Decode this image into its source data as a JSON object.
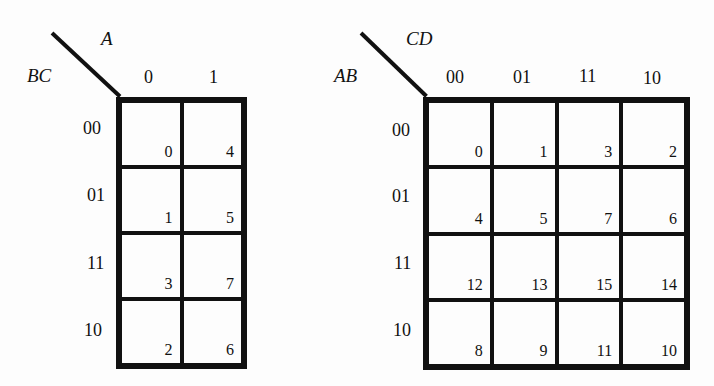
{
  "maps": [
    {
      "id": "three-variable",
      "col_var": "A",
      "row_var": "BC",
      "col_labels": [
        "0",
        "1"
      ],
      "row_labels": [
        "00",
        "01",
        "11",
        "10"
      ],
      "cells": [
        [
          "0",
          "4"
        ],
        [
          "1",
          "5"
        ],
        [
          "3",
          "7"
        ],
        [
          "2",
          "6"
        ]
      ]
    },
    {
      "id": "four-variable",
      "col_var": "CD",
      "row_var": "AB",
      "col_labels": [
        "00",
        "01",
        "11",
        "10"
      ],
      "row_labels": [
        "00",
        "01",
        "11",
        "10"
      ],
      "cells": [
        [
          "0",
          "1",
          "3",
          "2"
        ],
        [
          "4",
          "5",
          "7",
          "6"
        ],
        [
          "12",
          "13",
          "15",
          "14"
        ],
        [
          "8",
          "9",
          "11",
          "10"
        ]
      ]
    }
  ]
}
